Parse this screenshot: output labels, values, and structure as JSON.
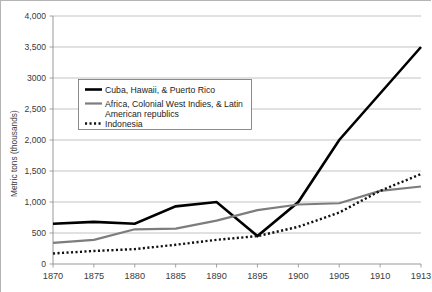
{
  "chart_data": {
    "type": "line",
    "title": "",
    "xlabel": "",
    "ylabel": "Metric tons (thousands)",
    "x": [
      1870,
      1875,
      1880,
      1885,
      1890,
      1895,
      1900,
      1905,
      1910,
      1913
    ],
    "xtick_labels": [
      "1870",
      "1875",
      "1880",
      "1885",
      "1890",
      "1895",
      "1900",
      "1905",
      "1910",
      "1913"
    ],
    "ylim": [
      0,
      4000
    ],
    "ytick_values": [
      0,
      500,
      1000,
      1500,
      2000,
      2500,
      3000,
      3500,
      4000
    ],
    "ytick_labels": [
      "0",
      "500",
      "1,000",
      "1,500",
      "2,000",
      "2,500",
      "3000",
      "3,500",
      "4,000"
    ],
    "grid": "horizontal",
    "legend_position": "inside-upper-left",
    "series": [
      {
        "name": "Cuba, Hawaii, & Puerto Rico",
        "style": "solid-thick-black",
        "color": "#000000",
        "values": [
          650,
          680,
          650,
          930,
          1000,
          450,
          1000,
          2000,
          2750,
          3500
        ]
      },
      {
        "name": "Africa, Colonial West Indies, & Latin American republics",
        "style": "solid-gray",
        "color": "#7d7d7d",
        "values": [
          340,
          390,
          560,
          570,
          700,
          870,
          960,
          980,
          1180,
          1250
        ]
      },
      {
        "name": "Indonesia",
        "style": "dotted-black",
        "color": "#111111",
        "values": [
          170,
          210,
          240,
          310,
          390,
          450,
          600,
          830,
          1180,
          1450
        ]
      }
    ]
  },
  "legend": {
    "entries": [
      {
        "label": "Cuba, Hawaii, & Puerto Rico"
      },
      {
        "label_line1": "Africa, Colonial West Indies, & Latin",
        "label_line2": "American republics"
      },
      {
        "label": "Indonesia"
      }
    ]
  },
  "axes": {
    "y_axis_title": "Metric tons (thousands)"
  }
}
